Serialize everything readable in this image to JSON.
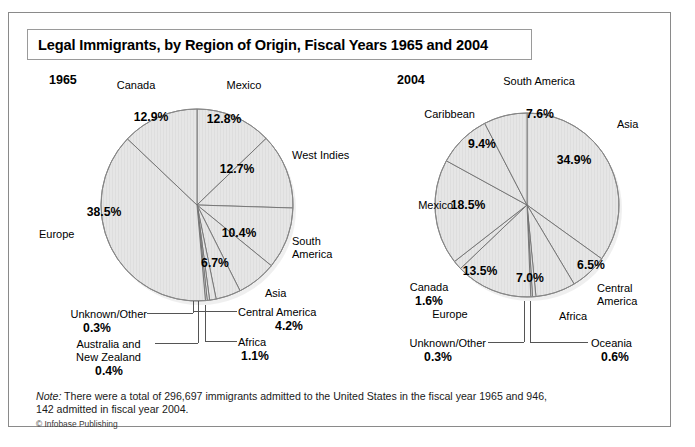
{
  "figure": {
    "title": "Legal Immigrants, by Region of Origin, Fiscal Years 1965 and 2004",
    "note_prefix": "Note:",
    "note_body": " There were a total of 296,697 immigrants admitted to the United States in the fiscal year 1965 and 946, 142 admitted in fiscal year 2004.",
    "credit": "© Infobase Publishing",
    "colors": {
      "slice_fill": "#e6e6e6",
      "slice_stroke": "#707070",
      "frame": "#8a8a8a",
      "text": "#000000"
    }
  },
  "panels": {
    "left": {
      "year": "1965"
    },
    "right": {
      "year": "2004"
    }
  },
  "chart_data": [
    {
      "type": "pie",
      "title": "1965",
      "start_angle_deg": 0,
      "direction": "clockwise",
      "units": "percent",
      "total_label": "296,697 immigrants admitted in fiscal year 1965",
      "categories": [
        "Mexico",
        "West Indies",
        "South America",
        "Asia",
        "Central America",
        "Africa",
        "Australia and New Zealand",
        "Unknown/Other",
        "Europe",
        "Canada"
      ],
      "values": [
        12.8,
        12.7,
        10.4,
        6.7,
        4.2,
        1.1,
        0.4,
        0.3,
        38.5,
        12.9
      ],
      "value_labels": [
        "12.8%",
        "12.7%",
        "10.4%",
        "6.7%",
        "4.2%",
        "1.1%",
        "0.4%",
        "0.3%",
        "38.5%",
        "12.9%"
      ],
      "slices": [
        {
          "label": "Mexico",
          "value": 12.8,
          "value_label": "12.8%"
        },
        {
          "label": "West Indies",
          "value": 12.7,
          "value_label": "12.7%"
        },
        {
          "label": "South America",
          "value": 10.4,
          "value_label": "10.4%"
        },
        {
          "label": "Asia",
          "value": 6.7,
          "value_label": "6.7%"
        },
        {
          "label": "Central America",
          "value": 4.2,
          "value_label": "4.2%"
        },
        {
          "label": "Africa",
          "value": 1.1,
          "value_label": "1.1%"
        },
        {
          "label": "Australia and New Zealand",
          "value": 0.4,
          "value_label": "0.4%"
        },
        {
          "label": "Unknown/Other",
          "value": 0.3,
          "value_label": "0.3%"
        },
        {
          "label": "Europe",
          "value": 38.5,
          "value_label": "38.5%"
        },
        {
          "label": "Canada",
          "value": 12.9,
          "value_label": "12.9%"
        }
      ],
      "legend": "none",
      "grid": false
    },
    {
      "type": "pie",
      "title": "2004",
      "start_angle_deg": 0,
      "direction": "clockwise",
      "units": "percent",
      "total_label": "946,142 immigrants admitted in fiscal year 2004",
      "categories": [
        "Asia",
        "Central America",
        "Africa",
        "Oceania",
        "Unknown/Other",
        "Europe",
        "Canada",
        "Mexico",
        "Caribbean",
        "South America"
      ],
      "values": [
        34.9,
        6.5,
        7.0,
        0.6,
        0.3,
        13.5,
        1.6,
        18.5,
        9.4,
        7.6
      ],
      "value_labels": [
        "34.9%",
        "6.5%",
        "7.0%",
        "0.6%",
        "0.3%",
        "13.5%",
        "1.6%",
        "18.5%",
        "9.4%",
        "7.6%"
      ],
      "slices": [
        {
          "label": "Asia",
          "value": 34.9,
          "value_label": "34.9%"
        },
        {
          "label": "Central America",
          "value": 6.5,
          "value_label": "6.5%"
        },
        {
          "label": "Africa",
          "value": 7.0,
          "value_label": "7.0%"
        },
        {
          "label": "Oceania",
          "value": 0.6,
          "value_label": "0.6%"
        },
        {
          "label": "Unknown/Other",
          "value": 0.3,
          "value_label": "0.3%"
        },
        {
          "label": "Europe",
          "value": 13.5,
          "value_label": "13.5%"
        },
        {
          "label": "Canada",
          "value": 1.6,
          "value_label": "1.6%"
        },
        {
          "label": "Mexico",
          "value": 18.5,
          "value_label": "18.5%"
        },
        {
          "label": "Caribbean",
          "value": 9.4,
          "value_label": "9.4%"
        },
        {
          "label": "South America",
          "value": 7.6,
          "value_label": "7.6%"
        }
      ],
      "legend": "none",
      "grid": false
    }
  ],
  "labels_1965": {
    "canada": "Canada",
    "canada_pct": "12.9%",
    "mexico": "Mexico",
    "mexico_pct": "12.8%",
    "west_indies": "West Indies",
    "west_indies_pct": "12.7%",
    "south_america": "South\nAmerica",
    "south_america_pct": "10.4%",
    "asia": "Asia",
    "asia_pct": "6.7%",
    "central_america": "Central America",
    "central_america_pct": "4.2%",
    "africa": "Africa",
    "africa_pct": "1.1%",
    "australia_nz": "Australia and\nNew Zealand",
    "australia_nz_pct": "0.4%",
    "europe": "Europe",
    "europe_pct": "38.5%",
    "unknown": "Unknown/Other",
    "unknown_pct": "0.3%"
  },
  "labels_2004": {
    "south_america": "South America",
    "south_america_pct": "7.6%",
    "caribbean": "Caribbean",
    "caribbean_pct": "9.4%",
    "asia": "Asia",
    "asia_pct": "34.9%",
    "mexico": "Mexico",
    "mexico_pct": "18.5%",
    "central_america": "Central\nAmerica",
    "central_america_pct": "6.5%",
    "africa": "Africa",
    "africa_pct": "7.0%",
    "canada": "Canada",
    "canada_pct": "1.6%",
    "europe": "Europe",
    "europe_pct": "13.5%",
    "unknown": "Unknown/Other",
    "unknown_pct": "0.3%",
    "oceania": "Oceania",
    "oceania_pct": "0.6%"
  }
}
